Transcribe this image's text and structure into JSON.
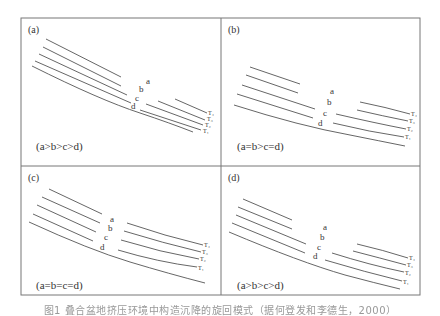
{
  "figure": {
    "frame": {
      "left": 21,
      "top": 18,
      "right": 420,
      "bottom": 295,
      "mid_x": 221,
      "mid_y": 166
    },
    "line_color": "#555555",
    "border_color": "#777777",
    "panels": [
      {
        "id": "a",
        "label": "(a)",
        "condition": "(a>b>c>d)",
        "layer_labels": [
          "a",
          "b",
          "c",
          "d"
        ],
        "T_labels": [
          "T₄",
          "T₃",
          "T₂",
          "T₁"
        ]
      },
      {
        "id": "b",
        "label": "(b)",
        "condition": "(a=b>c=d)",
        "layer_labels": [
          "a",
          "b",
          "c",
          "d"
        ],
        "T_labels": [
          "T₄",
          "T₃",
          "T₂",
          "T₁"
        ]
      },
      {
        "id": "c",
        "label": "(c)",
        "condition": "(a=b=c=d)",
        "layer_labels": [
          "a",
          "b",
          "c",
          "d"
        ],
        "T_labels": [
          "T₄",
          "T₃",
          "T₂",
          "T₁"
        ]
      },
      {
        "id": "d",
        "label": "(d)",
        "condition": "(a>b>c>d)",
        "layer_labels": [
          "a",
          "b",
          "c",
          "d"
        ],
        "T_labels": [
          "T₄",
          "T₃",
          "T₂",
          "T₁"
        ]
      }
    ],
    "caption": "图1  叠合盆地挤压环境中构造沉降的旋回模式（据何登发和李德生，2000）"
  }
}
